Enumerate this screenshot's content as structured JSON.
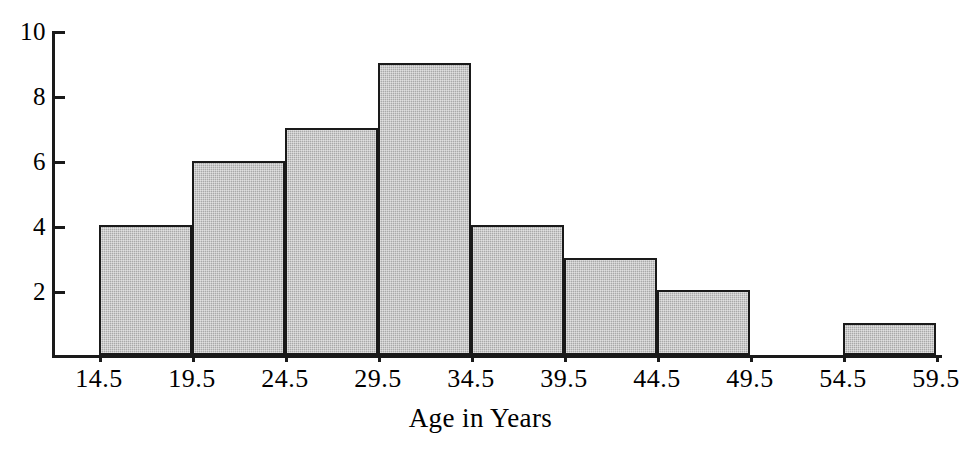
{
  "chart_data": {
    "type": "bar",
    "title": "",
    "subtitle": "",
    "xlabel": "Age in Years",
    "ylabel": "",
    "grid": false,
    "legend": "none",
    "bin_width": 5,
    "bin_edges": [
      14.5,
      19.5,
      24.5,
      29.5,
      34.5,
      39.5,
      44.5,
      49.5,
      54.5,
      59.5
    ],
    "categories": [
      "14.5-19.5",
      "19.5-24.5",
      "24.5-29.5",
      "29.5-34.5",
      "34.5-39.5",
      "39.5-44.5",
      "44.5-49.5",
      "49.5-54.5",
      "54.5-59.5"
    ],
    "values": [
      4,
      6,
      7,
      9,
      4,
      3,
      2,
      0,
      1
    ],
    "xlim": [
      14.5,
      59.5
    ],
    "ylim": [
      0,
      10
    ],
    "ytick_values": [
      2,
      4,
      6,
      8,
      10
    ],
    "ytick_labels": [
      "2",
      "4",
      "6",
      "8",
      "10"
    ],
    "xtick_labels": [
      "14.5",
      "19.5",
      "24.5",
      "29.5",
      "34.5",
      "39.5",
      "44.5",
      "49.5",
      "54.5",
      "59.5"
    ],
    "colors": {
      "bar_fill": "#a9a9a9",
      "bar_edge": "#1a1a1a",
      "axis": "#1a1a1a",
      "text": "#000000",
      "background": "#ffffff"
    }
  }
}
